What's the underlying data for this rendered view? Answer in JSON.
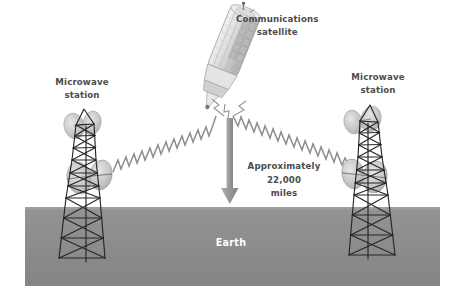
{
  "diagram": {
    "background_color": "#ffffff",
    "labels": {
      "satellite_line1": "Communications",
      "satellite_line2": "satellite",
      "left_station_line1": "Microwave",
      "left_station_line2": "station",
      "right_station_line1": "Microwave",
      "right_station_line2": "station",
      "distance_line1": "Approximately",
      "distance_line2": "22,000",
      "distance_line3": "miles",
      "earth": "Earth"
    },
    "colors": {
      "earth_band": "#8c8c8c",
      "label_text": "#4c4c4c",
      "earth_text": "#ffffff",
      "signal_wave": "#8e8e8e",
      "tower_line": "#2a2a2a",
      "dish": "#c9c9c9",
      "arrow": "#9a9a9a",
      "satellite_body": "#dcdcdc"
    },
    "elements": {
      "satellite_name": "communications-satellite",
      "left_tower_name": "left-microwave-tower",
      "right_tower_name": "right-microwave-tower",
      "uplink_name": "uplink-signal-wave",
      "downlink_name": "downlink-signal-wave",
      "altitude_arrow_name": "altitude-arrow",
      "earth_band_name": "earth-surface-band"
    }
  }
}
